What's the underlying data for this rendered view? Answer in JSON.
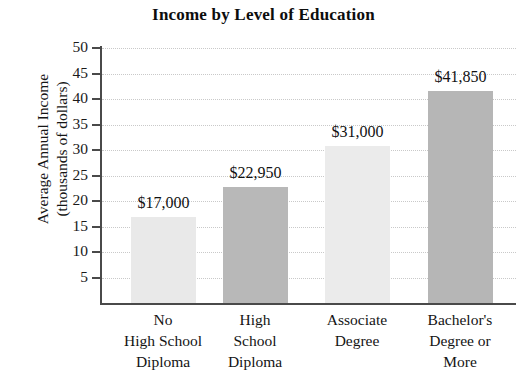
{
  "chart_data": {
    "type": "bar",
    "title": "Income by Level of Education",
    "xlabel": "",
    "ylabel": "Average Annual Income\n(thousands of dollars)",
    "ylim": [
      0,
      50
    ],
    "ytick_step": 5,
    "ytick_labels": [
      "50",
      "45",
      "40",
      "35",
      "30",
      "25",
      "20",
      "15",
      "10",
      "5"
    ],
    "ytick_values": [
      50,
      45,
      40,
      35,
      30,
      25,
      20,
      15,
      10,
      5
    ],
    "grid": true,
    "legend": "none",
    "categories": [
      "No\nHigh School\nDiploma",
      "High\nSchool\nDiploma",
      "Associate\nDegree",
      "Bachelor's\nDegree or\nMore"
    ],
    "values": [
      17.0,
      22.95,
      31.0,
      41.85
    ],
    "data_labels": [
      "$17,000",
      "$22,950",
      "$31,000",
      "$41,850"
    ],
    "bar_colors": [
      "#e9e9e9",
      "#b8b8b8",
      "#ebebeb",
      "#b6b6b6"
    ],
    "axis_color": "#4a4a4a",
    "grid_color": "#c9c9c9",
    "text_color": "#141414"
  }
}
